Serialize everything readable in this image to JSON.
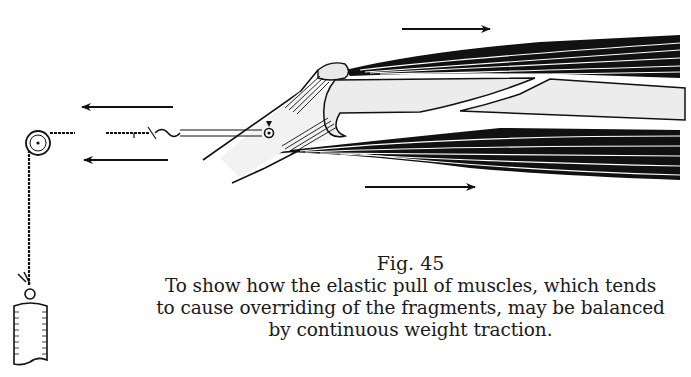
{
  "figure": {
    "label": "Fig. 45",
    "caption_lines": [
      "To show how the elastic pull of muscles, which tends",
      "to cause overriding of the fragments, may be balanced",
      "by continuous weight traction."
    ],
    "elements": {
      "arrows_left": [
        "traction-force-arrow-upper",
        "traction-force-arrow-lower"
      ],
      "arrows_right": [
        "muscle-pull-arrow-upper",
        "muscle-pull-arrow-lower"
      ],
      "apparatus": [
        "pulley",
        "traction-cord",
        "weight"
      ],
      "anatomy": [
        "fractured-bone",
        "upper-muscle-group",
        "lower-muscle-group",
        "limb-outline",
        "traction-pin"
      ]
    },
    "colors": {
      "ink": "#111111",
      "bone": "#ececec",
      "paper": "#ffffff"
    }
  }
}
